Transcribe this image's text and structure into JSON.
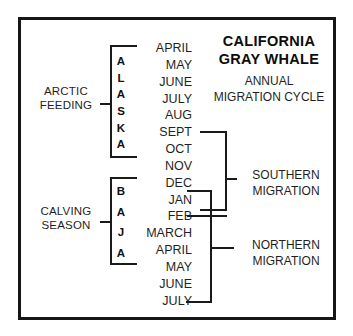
{
  "title": {
    "line1": "CALIFORNIA",
    "line2": "GRAY WHALE",
    "line3": "ANNUAL",
    "line4": "MIGRATION CYCLE"
  },
  "groups": {
    "arctic": {
      "line1": "ARCTIC",
      "line2": "FEEDING"
    },
    "calving": {
      "line1": "CALVING",
      "line2": "SEASON"
    }
  },
  "regions": {
    "alaska": {
      "name": "ALASKA",
      "letters": [
        "A",
        "L",
        "A",
        "S",
        "K",
        "A"
      ],
      "span": [
        "APRIL",
        "OCT"
      ]
    },
    "baja": {
      "name": "BAJA",
      "letters": [
        "B",
        "A",
        "J",
        "A"
      ],
      "span": [
        "DEC",
        "APRIL"
      ]
    }
  },
  "months": [
    "APRIL",
    "MAY",
    "JUNE",
    "JULY",
    "AUG",
    "SEPT",
    "OCT",
    "NOV",
    "DEC",
    "JAN",
    "FEB",
    "MARCH",
    "APRIL",
    "MAY",
    "JUNE",
    "JULY"
  ],
  "migrations": {
    "southern": {
      "line1": "SOUTHERN",
      "line2": "MIGRATION",
      "span": [
        "SEPT",
        "FEB"
      ]
    },
    "northern": {
      "line1": "NORTHERN",
      "line2": "MIGRATION",
      "span": [
        "MARCH",
        "JULY"
      ]
    }
  },
  "colors": {
    "ink": "#1a1a1a",
    "background": "#ffffff",
    "frame": "#161616"
  }
}
